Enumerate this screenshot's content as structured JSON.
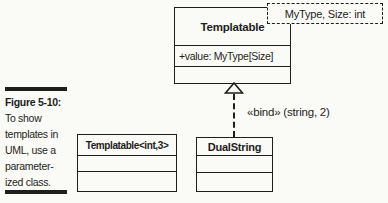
{
  "colors": {
    "paper": "#fafaf7",
    "ink": "#1e1e1c"
  },
  "figure": {
    "label": "Figure 5-10:",
    "caption_lines": [
      "To show",
      "templates in",
      "UML, use a",
      "parameter-",
      "ized class."
    ]
  },
  "diagram": {
    "parameterized_class": {
      "name": "Templatable",
      "attribute": "+value: MyType[Size]",
      "template_parameters": "MyType, Size: int"
    },
    "bind_label": "«bind» (string, 2)",
    "explicit_binding_class": {
      "name": "Templatable<int,3>"
    },
    "bound_class": {
      "name": "DualString"
    }
  }
}
